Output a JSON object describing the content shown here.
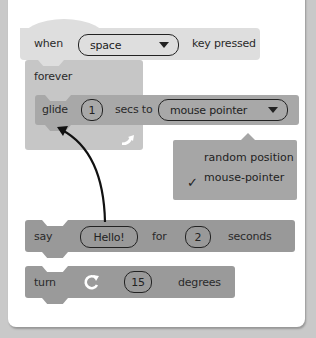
{
  "blocks": {
    "when": {
      "label": "when",
      "dropdown_value": "space",
      "suffix": "key pressed"
    },
    "forever": {
      "label": "forever",
      "loop_icon": "loop-arrow-icon"
    },
    "glide": {
      "label": "glide",
      "secs_value": "1",
      "middle": "secs to",
      "dropdown_value": "mouse pointer"
    },
    "say": {
      "label": "say",
      "message": "Hello!",
      "for_label": "for",
      "secs_value": "2",
      "suffix": "seconds"
    },
    "turn": {
      "label": "turn",
      "icon": "rotate-clockwise-icon",
      "value": "15",
      "suffix": "degrees"
    }
  },
  "dropdown_menu": {
    "items": [
      {
        "label": "random position",
        "checked": false
      },
      {
        "label": "mouse-pointer",
        "checked": true
      }
    ],
    "check_glyph": "✓"
  },
  "colors": {
    "hat": "#dedede",
    "control": "#c6c6c6",
    "motion": "#a8a8a8",
    "looks": "#999999",
    "background": "#c9c9c9"
  }
}
